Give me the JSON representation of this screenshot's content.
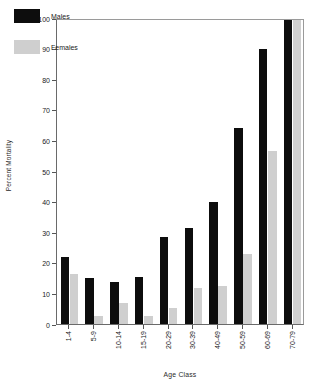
{
  "chart_data": {
    "type": "bar",
    "title": "",
    "xlabel": "Age Class",
    "ylabel": "Percent Mortality",
    "categories": [
      "1-4",
      "5-9",
      "10-14",
      "15-19",
      "20-29",
      "30-39",
      "40-49",
      "50-59",
      "60-69",
      "70-79"
    ],
    "series": [
      {
        "name": "Males",
        "color": "#0d0d0d",
        "values": [
          22,
          15,
          13.8,
          15.3,
          28.3,
          31.5,
          39.8,
          64,
          90,
          100
        ]
      },
      {
        "name": "Females",
        "color": "#cfcfcf",
        "values": [
          16.5,
          2.5,
          7,
          2.5,
          5.2,
          11.8,
          12.5,
          23,
          56.5,
          100
        ]
      }
    ],
    "ylim": [
      0,
      100
    ],
    "ytick_labels": [
      "0",
      "10",
      "20",
      "30",
      "40",
      "50",
      "60",
      "70",
      "80",
      "90",
      "100"
    ],
    "ytick_values": [
      0,
      10,
      20,
      30,
      40,
      50,
      60,
      70,
      80,
      90,
      100
    ],
    "grid": false,
    "legend_position": "top-left",
    "legend_entries": [
      "Males",
      "Females"
    ]
  }
}
